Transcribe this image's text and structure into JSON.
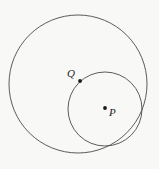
{
  "figure": {
    "background_color": "#f8f8f6",
    "stroke_color": "#4a4a4a",
    "dot_color": "#1a1a1a",
    "width": 159,
    "height": 169
  },
  "chart_data": {
    "type": "diagram",
    "title": "",
    "xlabel": "",
    "ylabel": "",
    "grid": false,
    "legend": "none",
    "shapes": [
      {
        "name": "outer-circle",
        "kind": "circle",
        "cx": 78,
        "cy": 84,
        "r": 69,
        "fill": "none",
        "stroke": "#4a4a4a"
      },
      {
        "name": "inner-circle",
        "kind": "circle",
        "cx": 105,
        "cy": 109,
        "r": 37,
        "fill": "none",
        "stroke": "#4a4a4a"
      }
    ],
    "points": [
      {
        "name": "point-Q",
        "label": "Q",
        "x": 80,
        "y": 81,
        "label_x": 67,
        "label_y": 68,
        "on": "inner-circle"
      },
      {
        "name": "point-P",
        "label": "P",
        "x": 105,
        "y": 108,
        "label_x": 109,
        "label_y": 107,
        "on": "center of inner-circle"
      }
    ]
  },
  "labels": {
    "q": "Q",
    "p": "P"
  }
}
